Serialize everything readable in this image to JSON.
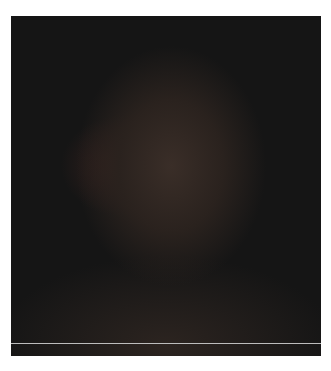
{
  "image": {
    "kind": "clinical-photograph",
    "alt": "Clinical photograph of a patient's face showing significant facial injury and swelling, against a dark background",
    "background_color": "#1a1a1a",
    "border_color": "#ffffff",
    "rule_color": "#bdbdbd"
  }
}
